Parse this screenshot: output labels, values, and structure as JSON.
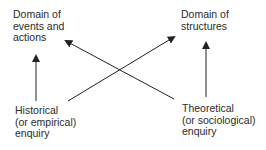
{
  "nodes": {
    "events": {
      "lines": [
        "Domain of",
        "events and",
        "actions"
      ]
    },
    "structures": {
      "lines": [
        "Domain of",
        "structures"
      ]
    },
    "historical": {
      "lines": [
        "Historical",
        "(or empirical)",
        "enquiry"
      ]
    },
    "theoretical": {
      "lines": [
        "Theoretical",
        "(or sociological)",
        "enquiry"
      ]
    }
  },
  "edges": [
    {
      "from": "historical",
      "to": "events"
    },
    {
      "from": "historical",
      "to": "structures"
    },
    {
      "from": "theoretical",
      "to": "structures"
    },
    {
      "from": "theoretical",
      "to": "events"
    }
  ],
  "colors": {
    "line": "#222222",
    "text": "#2a2a2a"
  }
}
